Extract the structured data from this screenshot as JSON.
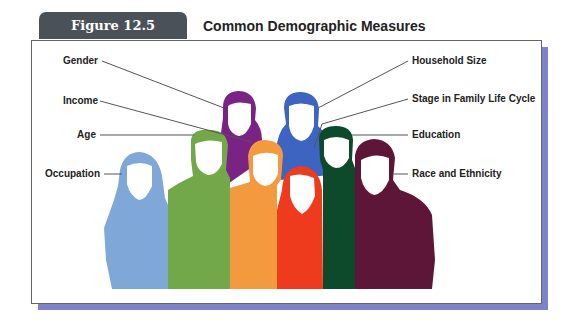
{
  "figure": {
    "tab_label": "Figure 12.5",
    "title": "Common Demographic Measures"
  },
  "labels_left": [
    {
      "text": "Gender",
      "points_to": "purple-figure"
    },
    {
      "text": "Income",
      "points_to": "orange-figure"
    },
    {
      "text": "Age",
      "points_to": "green-figure"
    },
    {
      "text": "Occupation",
      "points_to": "light-blue-figure"
    }
  ],
  "labels_right": [
    {
      "text": "Household Size",
      "points_to": "blue-figure"
    },
    {
      "text": "Stage in Family Life Cycle",
      "points_to": "red-figure"
    },
    {
      "text": "Education",
      "points_to": "dark-green-figure"
    },
    {
      "text": "Race and Ethnicity",
      "points_to": "maroon-figure"
    }
  ],
  "colors": {
    "tab": "#4b5159",
    "shadow": "#7d83c9",
    "light_blue": "#7fa8d8",
    "green": "#72a84a",
    "purple": "#7a2384",
    "orange": "#f39a3e",
    "blue": "#3d64c0",
    "red": "#ee3b1e",
    "dark_green": "#0d4a2c",
    "maroon": "#5e1638"
  }
}
